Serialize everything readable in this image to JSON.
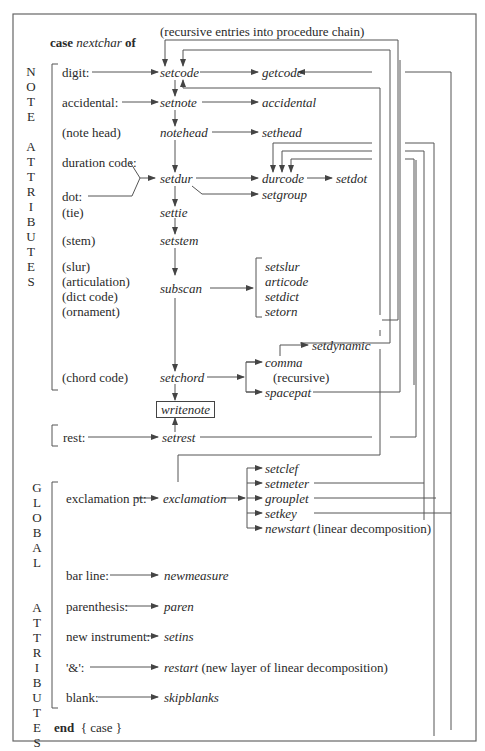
{
  "header": {
    "case_keyword": "case",
    "case_variable": "nextchar",
    "of_keyword": "of",
    "recursive_note": "(recursive entries into procedure chain)"
  },
  "note_attributes": {
    "side_label": [
      "N",
      "O",
      "T",
      "E",
      "",
      "A",
      "T",
      "T",
      "R",
      "I",
      "B",
      "U",
      "T",
      "E",
      "S"
    ],
    "inputs": {
      "digit": "digit:",
      "accidental": "accidental:",
      "note_head": "(note head)",
      "duration_code": "duration code:",
      "dot": "dot:",
      "tie": "(tie)",
      "stem": "(stem)",
      "slur": "(slur)",
      "articulation": "(articulation)",
      "dict_code": "(dict code)",
      "ornament": "(ornament)",
      "chord_code": "(chord code)"
    },
    "procedures": {
      "setcode": "setcode",
      "getcode": "getcode",
      "setnote": "setnote",
      "accidental": "accidental",
      "notehead": "notehead",
      "sethead": "sethead",
      "setdur": "setdur",
      "durcode": "durcode",
      "setdot": "setdot",
      "setgroup": "setgroup",
      "settie": "settie",
      "setstem": "setstem",
      "subscan": "subscan",
      "subscan_targets": [
        "setslur",
        "articode",
        "setdict",
        "setorn"
      ],
      "setchord": "setchord",
      "comma": "comma",
      "setdynamic": "setdynamic",
      "recursive_label": "(recursive)",
      "spacepat": "spacepat",
      "writenote": "writenote"
    }
  },
  "rest_section": {
    "input": "rest:",
    "procedure": "setrest"
  },
  "global_attributes": {
    "side_label": [
      "G",
      "L",
      "O",
      "B",
      "A",
      "L",
      "",
      "",
      "A",
      "T",
      "T",
      "R",
      "I",
      "B",
      "U",
      "T",
      "E",
      "S"
    ],
    "exclamation_input": "exclamation pt:",
    "exclamation_proc": "exclamation",
    "exclamation_targets": [
      "setclef",
      "setmeter",
      "grouplet",
      "setkey",
      "newstart"
    ],
    "newstart_note": "(linear decomposition)",
    "bar_line": "bar line:",
    "newmeasure": "newmeasure",
    "parenthesis": "parenthesis:",
    "paren": "paren",
    "new_instrument": "new instrument:",
    "setins": "setins",
    "ampersand": "'&':",
    "restart": "restart",
    "restart_note": "(new layer of linear decomposition)",
    "blank": "blank:",
    "skipblanks": "skipblanks"
  },
  "footer": {
    "end_keyword": "end",
    "end_comment": "{ case }"
  },
  "colors": {
    "line": "#555555",
    "text": "#2a2a2a",
    "border": "#666666"
  }
}
